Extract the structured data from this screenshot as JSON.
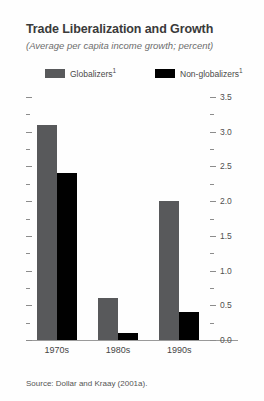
{
  "chart_data": {
    "type": "bar",
    "title": "Trade Liberalization and Growth",
    "subtitle": "(Average per capita income growth; percent)",
    "categories": [
      "1970s",
      "1980s",
      "1990s"
    ],
    "series": [
      {
        "name": "Globalizers",
        "footnote": "1",
        "color": "#58595b",
        "values": [
          3.1,
          0.6,
          2.0
        ]
      },
      {
        "name": "Non-globalizers",
        "footnote": "1",
        "color": "#000000",
        "values": [
          2.4,
          0.1,
          0.4
        ]
      }
    ],
    "xlabel": "",
    "ylabel": "",
    "ylim": [
      0.0,
      3.5
    ],
    "y_major_step": 0.5,
    "y_minor_step": 0.25,
    "y_tick_labels": [
      "3.5",
      "3.0",
      "2.5",
      "2.0",
      "1.5",
      "1.0",
      "0.5",
      "0.0"
    ],
    "y_axis_position": "right",
    "left_axis_ticks_unlabeled": true,
    "grid": false,
    "legend_position": "top",
    "source": "Source: Dollar and Kraay (2001a)."
  }
}
